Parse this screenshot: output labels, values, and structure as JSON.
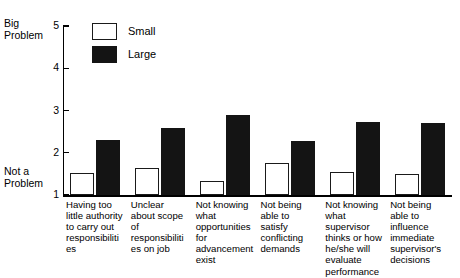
{
  "chart_data": {
    "type": "bar",
    "title": "",
    "subtitle": "",
    "xlabel": "",
    "ylabel": "",
    "ylim": [
      1,
      5
    ],
    "yticks": [
      "1",
      "2",
      "3",
      "4",
      "5"
    ],
    "y_axis_top_label": "Big\nProblem",
    "y_axis_bottom_label": "Not a\nProblem",
    "grid": false,
    "legend_position": "top-left-inside",
    "categories": [
      "Having too little authority to carry out responsibilities",
      "Unclear about scope of responsibilities on job",
      "Not knowing what opportunities for advancement exist",
      "Not being able to satisfy conflicting demands",
      "Not knowing what supervisor thinks or how he/she will evaluate performance",
      "Not being able to influence immediate supervisor's decisions"
    ],
    "series": [
      {
        "name": "Small",
        "color": "#ffffff",
        "values": [
          1.52,
          1.64,
          1.33,
          1.76,
          1.55,
          1.5
        ]
      },
      {
        "name": "Large",
        "color": "#141414",
        "values": [
          2.3,
          2.58,
          2.89,
          2.28,
          2.73,
          2.7
        ]
      }
    ]
  }
}
